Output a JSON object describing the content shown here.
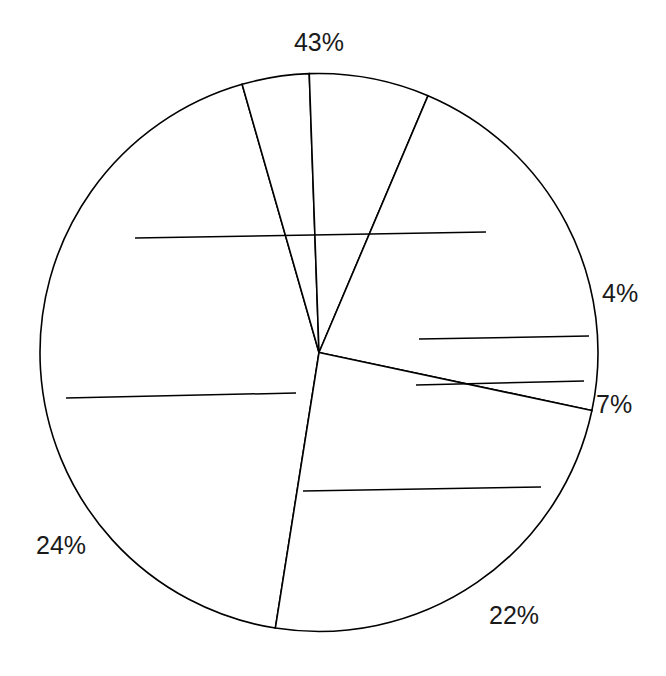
{
  "chart_data": {
    "type": "pie",
    "title": "",
    "subtitle": "",
    "xlabel": "",
    "ylabel": "",
    "grid": false,
    "legend": "none",
    "center": {
      "x": 319,
      "y": 352.5
    },
    "radius": 279,
    "slice_fill": "#ffffff",
    "slice_stroke": "#000000",
    "label_color": "#1a1a1a",
    "total_percent": 100,
    "categories": [
      "43%",
      "4%",
      "7%",
      "22%",
      "24%"
    ],
    "values": [
      43,
      4,
      7,
      22,
      24
    ],
    "slices": [
      {
        "label": "43%",
        "value": 43,
        "start_angle": 189,
        "end_angle": 344,
        "label_x": 319,
        "label_y": 44,
        "label_anchor": "middle",
        "leader": {
          "x1": 135,
          "y1": 238,
          "x2": 486,
          "y2": 232
        }
      },
      {
        "label": "4%",
        "value": 4,
        "start_angle": 344,
        "end_angle": 358,
        "label_x": 602,
        "label_y": 295,
        "label_anchor": "start",
        "leader": {
          "x1": 419,
          "y1": 339,
          "x2": 589,
          "y2": 336
        }
      },
      {
        "label": "7%",
        "value": 7,
        "start_angle": 358,
        "end_angle": 23,
        "label_x": 596,
        "label_y": 406,
        "label_anchor": "start",
        "leader": {
          "x1": 416,
          "y1": 385,
          "x2": 584,
          "y2": 381
        }
      },
      {
        "label": "22%",
        "value": 22,
        "start_angle": 23,
        "end_angle": 102,
        "label_x": 489,
        "label_y": 617,
        "label_anchor": "start",
        "leader": {
          "x1": 303,
          "y1": 491,
          "x2": 541,
          "y2": 487
        }
      },
      {
        "label": "24%",
        "value": 24,
        "start_angle": 102,
        "end_angle": 189,
        "label_x": 36,
        "label_y": 547,
        "label_anchor": "start",
        "leader": {
          "x1": 66,
          "y1": 398,
          "x2": 296,
          "y2": 393
        }
      }
    ]
  }
}
